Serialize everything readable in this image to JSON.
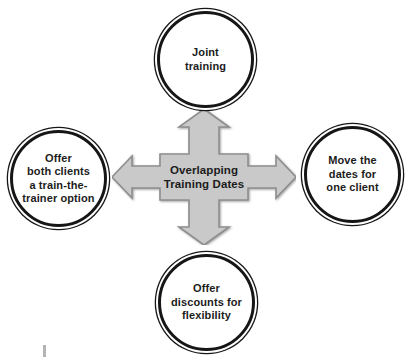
{
  "diagram": {
    "center": {
      "label": "Overlapping\nTraining Dates"
    },
    "nodes": {
      "top": {
        "label": "Joint\ntraining"
      },
      "right": {
        "label": "Move the\ndates for\none client"
      },
      "bottom": {
        "label": "Offer\ndiscounts for\nflexibility"
      },
      "left": {
        "label": "Offer\nboth clients\na train-the-\ntrainer option"
      }
    }
  },
  "colors": {
    "background": "#ffffff",
    "arrow_fill": "#c9c9c9",
    "arrow_outline": "#8e8e8e",
    "ring": "#161616",
    "text": "#1c1c1c",
    "artifact": "#b3b3b3"
  }
}
